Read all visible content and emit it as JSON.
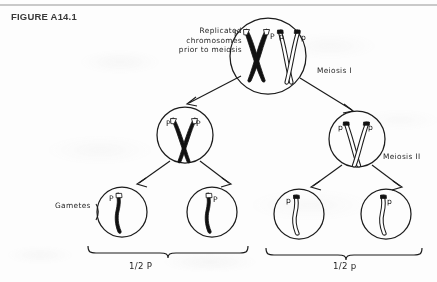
{
  "figure": {
    "id_label": "FIGURE A14.1",
    "topic": "meiosis-segregation-of-alleles"
  },
  "annotations": {
    "replicated": "Replicated\nchromosomes\nprior to meiosis",
    "replicated_line1": "Replicated",
    "replicated_line2": "chromosomes",
    "replicated_line3": "prior to meiosis",
    "meiosis_one": "Meiosis I",
    "meiosis_two": "Meiosis II",
    "gametes": "Gametes"
  },
  "ratios": {
    "left": "1/2 P",
    "right": "1/2 p"
  },
  "cells": {
    "parent": {
      "name": "parent-cell",
      "alleles": [
        "P",
        "P",
        "p",
        "p"
      ],
      "chromatid_labels_dark": [
        "P",
        "P"
      ],
      "chromatid_labels_light": [
        "p",
        "p"
      ]
    },
    "meiosis1_left": {
      "name": "daughter-cell-dark",
      "alleles": [
        "P",
        "P"
      ]
    },
    "meiosis1_right": {
      "name": "daughter-cell-light",
      "alleles": [
        "p",
        "p"
      ]
    },
    "gametes": [
      {
        "name": "gamete-1",
        "allele": "P",
        "shade": "dark"
      },
      {
        "name": "gamete-2",
        "allele": "P",
        "shade": "dark"
      },
      {
        "name": "gamete-3",
        "allele": "p",
        "shade": "light"
      },
      {
        "name": "gamete-4",
        "allele": "p",
        "shade": "light"
      }
    ]
  },
  "colors": {
    "ink": "#1c1c1c",
    "dark_chromosome": "#111111",
    "light_chromosome": "#ffffff",
    "page": "#fdfdfc",
    "rule": "#c9c9c9",
    "title": "#3a3a3a"
  }
}
